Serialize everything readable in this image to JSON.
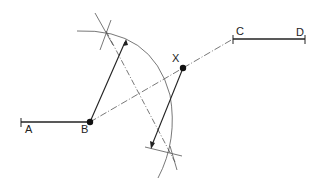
{
  "diagram": {
    "labels": {
      "A": "A",
      "B": "B",
      "C": "C",
      "D": "D",
      "X": "X"
    },
    "points": {
      "A": [
        21,
        122
      ],
      "B": [
        90,
        122
      ],
      "C": [
        233,
        39
      ],
      "D": [
        305,
        39
      ],
      "X": [
        183,
        68
      ]
    },
    "colors": {
      "line": "#222222",
      "thin": "#555555",
      "background": "#ffffff"
    }
  }
}
